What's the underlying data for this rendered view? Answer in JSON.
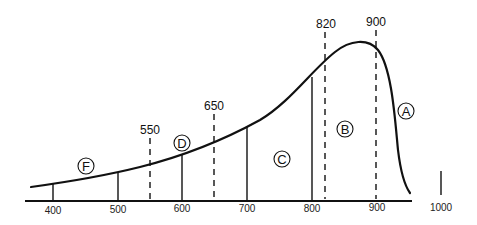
{
  "diagram": {
    "colors": {
      "line": "#111111",
      "background": "#ffffff"
    },
    "axis": {
      "ticks": [
        {
          "label": "400",
          "x": 53
        },
        {
          "label": "500",
          "x": 118
        },
        {
          "label": "600",
          "x": 182
        },
        {
          "label": "700",
          "x": 247
        },
        {
          "label": "800",
          "x": 312
        },
        {
          "label": "900",
          "x": 377
        }
      ],
      "extra_tick": {
        "label": "1000",
        "x": 441
      }
    },
    "dashed_markers": [
      {
        "label": "550",
        "x": 150
      },
      {
        "label": "650",
        "x": 214
      },
      {
        "label": "820",
        "x": 325
      },
      {
        "label": "900",
        "x": 376
      }
    ],
    "regions": [
      {
        "letter": "F",
        "x": 86,
        "y": 166
      },
      {
        "letter": "D",
        "x": 182,
        "y": 143
      },
      {
        "letter": "C",
        "x": 282,
        "y": 159
      },
      {
        "letter": "B",
        "x": 345,
        "y": 129
      },
      {
        "letter": "A",
        "x": 406,
        "y": 111
      }
    ]
  }
}
